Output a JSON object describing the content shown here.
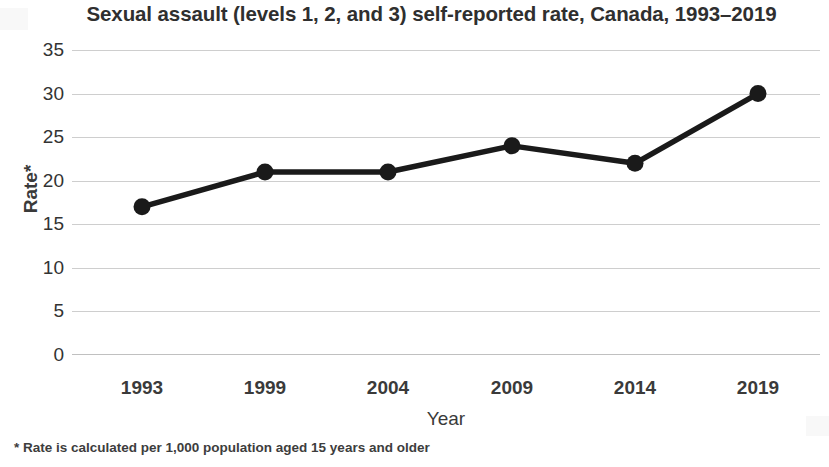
{
  "chart_data": {
    "type": "line",
    "title": "Sexual assault (levels 1, 2, and 3) self-reported rate, Canada, 1993–2019",
    "xlabel": "Year",
    "ylabel": "Rate*",
    "categories": [
      "1993",
      "1999",
      "2004",
      "2009",
      "2014",
      "2019"
    ],
    "values": [
      17,
      21,
      21,
      24,
      22,
      30
    ],
    "series": [
      {
        "name": "Sexual assault self-reported rate",
        "values": [
          17,
          21,
          21,
          24,
          22,
          30
        ]
      }
    ],
    "ylim": [
      0,
      35
    ],
    "ytick_values": [
      35,
      30,
      25,
      20,
      15,
      10,
      5,
      0
    ],
    "ytick_labels": [
      "35",
      "30",
      "25",
      "20",
      "15",
      "10",
      "5",
      "0"
    ],
    "grid": true,
    "grid_axis": "y",
    "legend": false,
    "legend_position": "none",
    "marker": "circle",
    "line_color": "#1a1a1a",
    "marker_color": "#1a1a1a",
    "grid_color": "#c6c6c6",
    "background_color": "#ffffff",
    "footnote": "* Rate is calculated per 1,000 population aged 15 years and older"
  }
}
